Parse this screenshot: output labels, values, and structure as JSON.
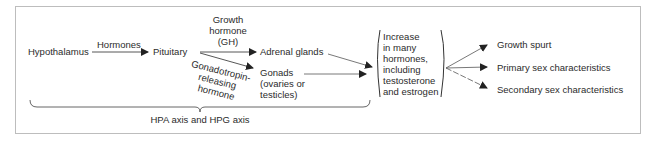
{
  "diagram": {
    "nodes": {
      "hypothalamus": "Hypothalamus",
      "pituitary": "Pituitary",
      "adrenal_glands": "Adrenal glands",
      "gonads": [
        "Gonads",
        "(ovaries or",
        "testicles)"
      ],
      "increase_box": [
        "Increase",
        "in many",
        "hormones,",
        "including",
        "testosterone",
        "and estrogen"
      ],
      "outcomes": [
        "Growth spurt",
        "Primary sex characteristics",
        "Secondary sex characteristics"
      ]
    },
    "edges": {
      "hormones_label": "Hormones",
      "gh_label": [
        "Growth",
        "hormone",
        "(GH)"
      ],
      "gnrh_label": [
        "Gonadotropin-",
        "releasing",
        "hormone"
      ]
    },
    "brace_label": "HPA axis and HPG axis",
    "colors": {
      "text": "#2b2b2b",
      "lines": "#333333",
      "frame": "#bdbdbd"
    }
  }
}
